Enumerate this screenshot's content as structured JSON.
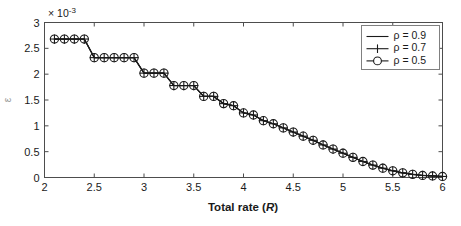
{
  "figure": {
    "title": "",
    "exponent_label": "× 10",
    "exponent_sup": "-3"
  },
  "chart_data": {
    "type": "line",
    "title": "",
    "subtitle": "",
    "xlabel": "Total rate (R)",
    "ylabel": "ε",
    "y_multiplier": "× 10^-3",
    "xlim": [
      2,
      6
    ],
    "ylim": [
      0,
      0.003
    ],
    "xticks": [
      2,
      2.5,
      3,
      3.5,
      4,
      4.5,
      5,
      5.5,
      6
    ],
    "xticklabels": [
      "2",
      "2.5",
      "3",
      "3.5",
      "4",
      "4.5",
      "5",
      "5.5",
      "6"
    ],
    "yticks": [
      0,
      0.0005,
      0.001,
      0.0015,
      0.002,
      0.0025,
      0.003
    ],
    "yticklabels": [
      "0",
      "0.5",
      "1",
      "1.5",
      "2",
      "2.5",
      "3"
    ],
    "grid": false,
    "legend_position": "upper right",
    "marker_note": "All three series overlap; circle and plus markers coincide",
    "x": [
      2.1,
      2.2,
      2.3,
      2.4,
      2.5,
      2.6,
      2.7,
      2.8,
      2.9,
      3.0,
      3.1,
      3.2,
      3.3,
      3.4,
      3.5,
      3.6,
      3.7,
      3.8,
      3.9,
      4.0,
      4.1,
      4.2,
      4.3,
      4.4,
      4.5,
      4.6,
      4.7,
      4.8,
      4.9,
      5.0,
      5.1,
      5.2,
      5.3,
      5.4,
      5.5,
      5.6,
      5.7,
      5.8,
      5.9,
      6.0
    ],
    "series": [
      {
        "name": "ρ = 0.9",
        "marker": "none",
        "linestyle": "solid",
        "color": "#1a1a1a",
        "values": [
          0.00268,
          0.00268,
          0.00268,
          0.00268,
          0.00232,
          0.00232,
          0.00232,
          0.00232,
          0.00232,
          0.00202,
          0.00202,
          0.00202,
          0.00178,
          0.00178,
          0.00178,
          0.00157,
          0.00157,
          0.00143,
          0.00139,
          0.00125,
          0.00121,
          0.0011,
          0.00104,
          0.00096,
          0.00088,
          0.0008,
          0.00072,
          0.00063,
          0.00055,
          0.00047,
          0.00039,
          0.00031,
          0.00024,
          0.00018,
          0.00013,
          9e-05,
          6e-05,
          4e-05,
          3e-05,
          2e-05
        ]
      },
      {
        "name": "ρ = 0.7",
        "marker": "plus",
        "linestyle": "solid",
        "color": "#1a1a1a",
        "values": [
          0.00268,
          0.00268,
          0.00268,
          0.00268,
          0.00232,
          0.00232,
          0.00232,
          0.00232,
          0.00232,
          0.00202,
          0.00202,
          0.00202,
          0.00178,
          0.00178,
          0.00178,
          0.00157,
          0.00157,
          0.00143,
          0.00139,
          0.00125,
          0.00121,
          0.0011,
          0.00104,
          0.00096,
          0.00088,
          0.0008,
          0.00072,
          0.00063,
          0.00055,
          0.00047,
          0.00039,
          0.00031,
          0.00024,
          0.00018,
          0.00013,
          9e-05,
          6e-05,
          4e-05,
          3e-05,
          2e-05
        ]
      },
      {
        "name": "ρ = 0.5",
        "marker": "circle",
        "linestyle": "solid",
        "color": "#1a1a1a",
        "values": [
          0.00268,
          0.00268,
          0.00268,
          0.00268,
          0.00232,
          0.00232,
          0.00232,
          0.00232,
          0.00232,
          0.00202,
          0.00202,
          0.00202,
          0.00178,
          0.00178,
          0.00178,
          0.00157,
          0.00157,
          0.00143,
          0.00139,
          0.00125,
          0.00121,
          0.0011,
          0.00104,
          0.00096,
          0.00088,
          0.0008,
          0.00072,
          0.00063,
          0.00055,
          0.00047,
          0.00039,
          0.00031,
          0.00024,
          0.00018,
          0.00013,
          9e-05,
          6e-05,
          4e-05,
          3e-05,
          2e-05
        ]
      }
    ]
  },
  "legend": {
    "entries": [
      {
        "label": "ρ = 0.9",
        "marker": "none"
      },
      {
        "label": "ρ = 0.7",
        "marker": "plus"
      },
      {
        "label": "ρ = 0.5",
        "marker": "circle"
      }
    ]
  },
  "colors": {
    "line": "#1a1a1a",
    "axis": "#4d4d4d",
    "legend_border": "#808080",
    "background": "#ffffff"
  }
}
